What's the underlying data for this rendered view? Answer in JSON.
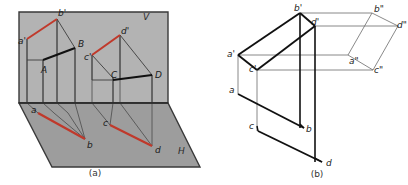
{
  "figure": {
    "title_a": "(a)",
    "title_b": "(b)",
    "background_color": "#ffffff",
    "plane_v_fill": "#b0b0b0",
    "plane_h_fill": "#9a9a9a",
    "line_color": "#1a1a1a",
    "thin_line_color": "#4a4a4a",
    "highlight_color": "#c0392b",
    "projection_line_color": "#555555"
  },
  "panel_a": {
    "caption": "(a)",
    "plane_labels": [
      {
        "name": "vertical-plane",
        "text": "V",
        "x": 143,
        "y": 16
      },
      {
        "name": "horizontal-plane",
        "text": "H",
        "x": 178,
        "y": 151
      }
    ],
    "vertices": [
      {
        "name": "a-prime",
        "text": "a'",
        "x": 22,
        "y": 44
      },
      {
        "name": "b-prime",
        "text": "b'",
        "x": 59,
        "y": 16
      },
      {
        "name": "B-point",
        "text": "B",
        "x": 79,
        "y": 47
      },
      {
        "name": "A-point",
        "text": "A",
        "x": 44,
        "y": 70
      },
      {
        "name": "c-prime",
        "text": "c'",
        "x": 88,
        "y": 60
      },
      {
        "name": "d-prime",
        "text": "d'",
        "x": 122,
        "y": 34
      },
      {
        "name": "C-point",
        "text": "C",
        "x": 113,
        "y": 83
      },
      {
        "name": "D-point",
        "text": "D",
        "x": 156,
        "y": 78
      },
      {
        "name": "a-point",
        "text": "a",
        "x": 33,
        "y": 114
      },
      {
        "name": "b-point",
        "text": "b",
        "x": 86,
        "y": 148
      },
      {
        "name": "c-point",
        "text": "c",
        "x": 104,
        "y": 127
      },
      {
        "name": "d-point",
        "text": "d",
        "x": 156,
        "y": 152
      }
    ]
  },
  "panel_b": {
    "caption": "(b)",
    "vertices": [
      {
        "name": "b-prime",
        "text": "b'",
        "x": 296,
        "y": 11
      },
      {
        "name": "b-double-prime",
        "text": "b\"",
        "x": 375,
        "y": 13
      },
      {
        "name": "d-prime",
        "text": "d'",
        "x": 313,
        "y": 27
      },
      {
        "name": "d-double-prime",
        "text": "d\"",
        "x": 397,
        "y": 30
      },
      {
        "name": "a-prime",
        "text": "a'",
        "x": 228,
        "y": 61
      },
      {
        "name": "a-double-prime",
        "text": "a\"",
        "x": 349,
        "y": 65
      },
      {
        "name": "c-prime",
        "text": "c'",
        "x": 250,
        "y": 75
      },
      {
        "name": "c-double-prime",
        "text": "c\"",
        "x": 373,
        "y": 74
      },
      {
        "name": "a-point",
        "text": "a",
        "x": 229,
        "y": 96
      },
      {
        "name": "b-point",
        "text": "b",
        "x": 307,
        "y": 131
      },
      {
        "name": "c-point",
        "text": "c",
        "x": 250,
        "y": 130
      },
      {
        "name": "d-point",
        "text": "d",
        "x": 327,
        "y": 165
      }
    ]
  }
}
